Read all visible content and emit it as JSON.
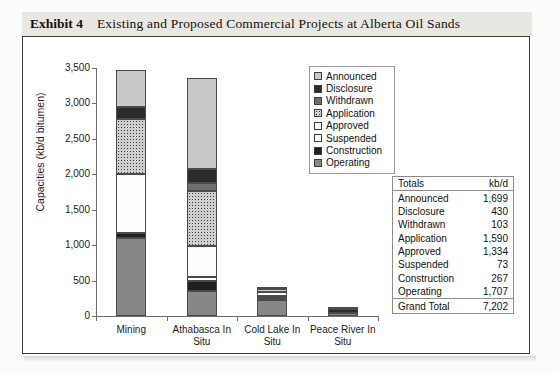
{
  "exhibit": {
    "label": "Exhibit 4",
    "title": "Existing and Proposed Commercial Projects at Alberta Oil Sands"
  },
  "legend": {
    "items": [
      {
        "label": "Announced",
        "key": "announced"
      },
      {
        "label": "Disclosure",
        "key": "disclosure"
      },
      {
        "label": "Withdrawn",
        "key": "withdrawn"
      },
      {
        "label": "Application",
        "key": "application"
      },
      {
        "label": "Approved",
        "key": "approved"
      },
      {
        "label": "Suspended",
        "key": "suspended"
      },
      {
        "label": "Construction",
        "key": "construction"
      },
      {
        "label": "Operating",
        "key": "operating"
      }
    ]
  },
  "totals": {
    "header": {
      "name": "Totals",
      "unit": "kb/d"
    },
    "rows": [
      {
        "name": "Announced",
        "value": "1,699"
      },
      {
        "name": "Disclosure",
        "value": "430"
      },
      {
        "name": "Withdrawn",
        "value": "103"
      },
      {
        "name": "Application",
        "value": "1,590"
      },
      {
        "name": "Approved",
        "value": "1,334"
      },
      {
        "name": "Suspended",
        "value": "73"
      },
      {
        "name": "Construction",
        "value": "267"
      },
      {
        "name": "Operating",
        "value": "1,707"
      }
    ],
    "grand": {
      "name": "Grand Total",
      "value": "7,202"
    }
  },
  "chart_data": {
    "type": "bar",
    "stacked": true,
    "title": "Existing and Proposed Commercial Projects at Alberta Oil Sands",
    "xlabel": "",
    "ylabel": "Capacities (kb/d bitumen)",
    "ylim": [
      0,
      3500
    ],
    "yticks": [
      "0",
      "500",
      "1,000",
      "1,500",
      "2,000",
      "2,500",
      "3,000",
      "3,500"
    ],
    "ytick_values": [
      0,
      500,
      1000,
      1500,
      2000,
      2500,
      3000,
      3500
    ],
    "grid": false,
    "legend_position": "top-right",
    "categories": [
      "Mining",
      "Athabasca In Situ",
      "Cold Lake In Situ",
      "Peace River In Situ"
    ],
    "series": [
      {
        "name": "Operating",
        "values": [
          1100,
          350,
          220,
          37
        ],
        "color": "#878787"
      },
      {
        "name": "Construction",
        "values": [
          75,
          150,
          30,
          12
        ],
        "color": "#1f1f1f"
      },
      {
        "name": "Suspended",
        "values": [
          0,
          45,
          28,
          0
        ],
        "color": "#ffffff"
      },
      {
        "name": "Approved",
        "values": [
          825,
          445,
          64,
          0
        ],
        "color": "#fdfdfb"
      },
      {
        "name": "Application",
        "values": [
          775,
          780,
          35,
          0
        ],
        "color": "#cfcfcf"
      },
      {
        "name": "Withdrawn",
        "values": [
          0,
          103,
          0,
          0
        ],
        "color": "#6f6f6f"
      },
      {
        "name": "Disclosure",
        "values": [
          175,
          200,
          5,
          50
        ],
        "color": "#2b2b2b"
      },
      {
        "name": "Announced",
        "values": [
          525,
          1280,
          0,
          30
        ],
        "color": "#c8c8c8"
      }
    ],
    "totals_by_category": [
      3475,
      3353,
      382,
      129
    ]
  }
}
